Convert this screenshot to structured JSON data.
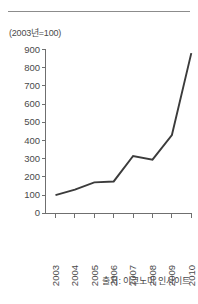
{
  "unit_label": "(2003년=100)",
  "source_note": "출처: 이코노미 인사이트",
  "colors": {
    "line": "#3b3b3b",
    "axis": "#6f6f6f",
    "rule": "#8c8c8c",
    "text": "#4a4a4a",
    "background": "#ffffff"
  },
  "chart_data": {
    "type": "line",
    "title": "",
    "subtitle": "",
    "xlabel": "",
    "ylabel": "(2003년=100)",
    "categories": [
      "2003",
      "2004",
      "2005",
      "2006",
      "2007",
      "2008",
      "2009",
      "2010"
    ],
    "x": [
      2003,
      2004,
      2005,
      2006,
      2007,
      2008,
      2009,
      2010
    ],
    "values": [
      100,
      130,
      170,
      175,
      315,
      295,
      430,
      880
    ],
    "series": [
      {
        "name": "지수",
        "values": [
          100,
          130,
          170,
          175,
          315,
          295,
          430,
          880
        ]
      }
    ],
    "ylim": [
      0,
      900
    ],
    "yticks": [
      0,
      100,
      200,
      300,
      400,
      500,
      600,
      700,
      800,
      900
    ],
    "ytick_labels": [
      "0",
      "100",
      "200",
      "300",
      "400",
      "500",
      "600",
      "700",
      "800",
      "900"
    ],
    "xtick_labels": [
      "2003",
      "2004",
      "2005",
      "2006",
      "2007",
      "2008",
      "2009",
      "2010"
    ],
    "grid": false,
    "legend": false,
    "legend_position": "none",
    "xtick_rotation": 90,
    "annotations": [
      "(2003년=100)",
      "출처: 이코노미 인사이트"
    ]
  }
}
